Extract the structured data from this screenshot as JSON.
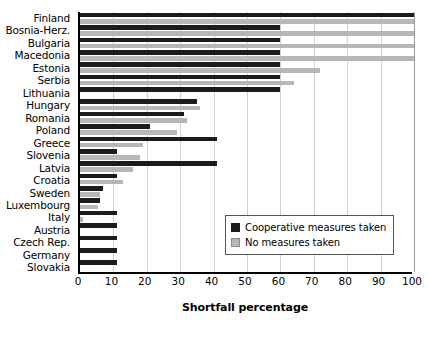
{
  "chart_data": {
    "type": "bar",
    "orientation": "horizontal",
    "title": "",
    "xlabel": "Shortfall percentage",
    "ylabel": "",
    "xlim": [
      0,
      100
    ],
    "xticks": [
      0,
      10,
      20,
      30,
      40,
      50,
      60,
      70,
      80,
      90,
      100
    ],
    "grid": true,
    "legend_position": "inside-right-lower",
    "categories": [
      "Finland",
      "Bosnia-Herz.",
      "Bulgaria",
      "Macedonia",
      "Estonia",
      "Serbia",
      "Lithuania",
      "Hungary",
      "Romania",
      "Poland",
      "Greece",
      "Slovenia",
      "Latvia",
      "Croatia",
      "Sweden",
      "Luxembourg",
      "Italy",
      "Austria",
      "Czech Rep.",
      "Germany",
      "Slovakia"
    ],
    "series": [
      {
        "name": "Cooperative measures taken",
        "color": "#1c1c1c",
        "values": [
          100,
          60,
          60,
          60,
          60,
          60,
          60,
          35,
          31,
          21,
          41,
          11,
          41,
          11,
          7,
          6,
          11,
          11,
          11,
          11,
          11
        ]
      },
      {
        "name": "No measures taken",
        "color": "#b7b7b7",
        "values": [
          100,
          100,
          100,
          100,
          72,
          64,
          0,
          36,
          32,
          29,
          19,
          18,
          16,
          13,
          6,
          5.5,
          1,
          0,
          0,
          0,
          0
        ]
      }
    ]
  },
  "legend": {
    "items": [
      {
        "label": "Cooperative measures taken",
        "swatch": "dark"
      },
      {
        "label": "No measures taken",
        "swatch": "light"
      }
    ]
  }
}
